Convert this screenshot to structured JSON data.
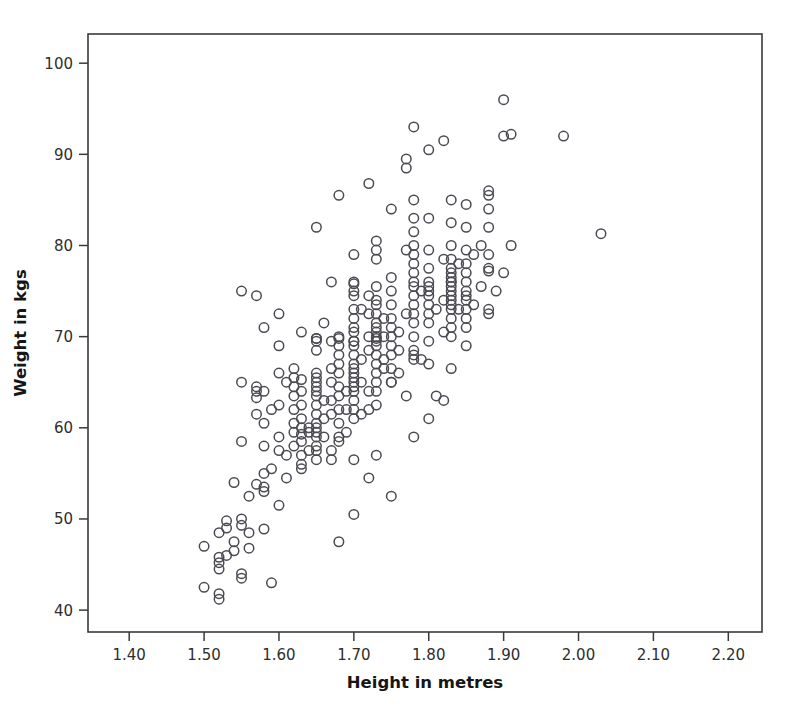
{
  "chart_data": {
    "type": "scatter",
    "title": "",
    "xlabel": "Height in metres",
    "ylabel": "Weight in kgs",
    "xlim": [
      1.345,
      2.245
    ],
    "ylim": [
      37.6,
      103.2
    ],
    "xticks": [
      "1.40",
      "1.50",
      "1.60",
      "1.70",
      "1.80",
      "1.90",
      "2.00",
      "2.10",
      "2.20"
    ],
    "xtick_values": [
      1.4,
      1.5,
      1.6,
      1.7,
      1.8,
      1.9,
      2.0,
      2.1,
      2.2
    ],
    "yticks": [
      "40",
      "50",
      "60",
      "70",
      "80",
      "90",
      "100"
    ],
    "ytick_values": [
      40,
      50,
      60,
      70,
      80,
      90,
      100
    ],
    "grid": false,
    "legend": null,
    "marker": "open-circle",
    "marker_color": "#4a4a52",
    "marker_size": 9.5,
    "n_points": 312,
    "x": [
      1.5,
      1.5,
      1.52,
      1.52,
      1.52,
      1.52,
      1.52,
      1.52,
      1.53,
      1.53,
      1.53,
      1.54,
      1.54,
      1.54,
      1.55,
      1.55,
      1.55,
      1.55,
      1.55,
      1.55,
      1.55,
      1.56,
      1.56,
      1.56,
      1.57,
      1.57,
      1.57,
      1.57,
      1.57,
      1.57,
      1.58,
      1.58,
      1.58,
      1.58,
      1.58,
      1.58,
      1.58,
      1.58,
      1.59,
      1.59,
      1.59,
      1.6,
      1.6,
      1.6,
      1.6,
      1.6,
      1.6,
      1.6,
      1.61,
      1.61,
      1.61,
      1.62,
      1.62,
      1.62,
      1.62,
      1.62,
      1.62,
      1.62,
      1.62,
      1.63,
      1.63,
      1.63,
      1.63,
      1.63,
      1.63,
      1.63,
      1.63,
      1.63,
      1.63,
      1.63,
      1.64,
      1.64,
      1.64,
      1.65,
      1.65,
      1.65,
      1.65,
      1.65,
      1.65,
      1.65,
      1.65,
      1.65,
      1.65,
      1.65,
      1.65,
      1.65,
      1.65,
      1.65,
      1.65,
      1.65,
      1.65,
      1.65,
      1.66,
      1.66,
      1.66,
      1.66,
      1.67,
      1.67,
      1.67,
      1.67,
      1.67,
      1.67,
      1.67,
      1.67,
      1.68,
      1.68,
      1.68,
      1.68,
      1.68,
      1.68,
      1.68,
      1.68,
      1.68,
      1.68,
      1.68,
      1.68,
      1.68,
      1.69,
      1.69,
      1.69,
      1.7,
      1.7,
      1.7,
      1.7,
      1.7,
      1.7,
      1.7,
      1.7,
      1.7,
      1.7,
      1.7,
      1.7,
      1.7,
      1.7,
      1.7,
      1.7,
      1.7,
      1.7,
      1.7,
      1.7,
      1.7,
      1.7,
      1.7,
      1.7,
      1.71,
      1.71,
      1.71,
      1.71,
      1.72,
      1.72,
      1.72,
      1.72,
      1.72,
      1.72,
      1.72,
      1.72,
      1.73,
      1.73,
      1.73,
      1.73,
      1.73,
      1.73,
      1.73,
      1.73,
      1.73,
      1.73,
      1.73,
      1.73,
      1.73,
      1.73,
      1.73,
      1.73,
      1.73,
      1.73,
      1.73,
      1.73,
      1.74,
      1.74,
      1.74,
      1.74,
      1.75,
      1.75,
      1.75,
      1.75,
      1.75,
      1.75,
      1.75,
      1.75,
      1.75,
      1.75,
      1.75,
      1.75,
      1.76,
      1.76,
      1.76,
      1.77,
      1.77,
      1.77,
      1.77,
      1.77,
      1.78,
      1.78,
      1.78,
      1.78,
      1.78,
      1.78,
      1.78,
      1.78,
      1.78,
      1.78,
      1.78,
      1.78,
      1.78,
      1.78,
      1.78,
      1.78,
      1.78,
      1.78,
      1.79,
      1.79,
      1.8,
      1.8,
      1.8,
      1.8,
      1.8,
      1.8,
      1.8,
      1.8,
      1.8,
      1.8,
      1.8,
      1.8,
      1.8,
      1.8,
      1.81,
      1.81,
      1.82,
      1.82,
      1.82,
      1.82,
      1.82,
      1.83,
      1.83,
      1.83,
      1.83,
      1.83,
      1.83,
      1.83,
      1.83,
      1.83,
      1.83,
      1.83,
      1.83,
      1.83,
      1.83,
      1.83,
      1.83,
      1.83,
      1.83,
      1.84,
      1.84,
      1.85,
      1.85,
      1.85,
      1.85,
      1.85,
      1.85,
      1.85,
      1.85,
      1.85,
      1.85,
      1.85,
      1.85,
      1.85,
      1.86,
      1.86,
      1.87,
      1.87,
      1.88,
      1.88,
      1.88,
      1.88,
      1.88,
      1.88,
      1.88,
      1.88,
      1.88,
      1.89,
      1.9,
      1.9,
      1.9,
      1.91,
      1.91,
      1.98,
      2.03,
      1.65,
      1.68,
      1.7,
      1.73,
      1.75,
      1.78,
      1.83
    ],
    "y": [
      47.0,
      42.5,
      45.8,
      45.2,
      44.5,
      41.8,
      41.2,
      48.5,
      49.8,
      49.0,
      46.0,
      54.0,
      47.5,
      46.5,
      75.0,
      65.0,
      58.5,
      50.0,
      49.3,
      44.0,
      43.5,
      52.5,
      48.5,
      46.8,
      74.5,
      64.5,
      64.0,
      63.3,
      61.5,
      53.8,
      71.0,
      64.0,
      60.5,
      58.0,
      55.0,
      53.5,
      53.0,
      48.9,
      62.0,
      55.5,
      43.0,
      72.5,
      69.0,
      66.0,
      62.5,
      59.0,
      57.5,
      51.5,
      65.0,
      57.0,
      54.5,
      66.5,
      65.5,
      64.5,
      63.5,
      62.0,
      60.5,
      59.5,
      58.0,
      70.5,
      65.3,
      64.0,
      62.5,
      61.0,
      60.0,
      59.3,
      58.5,
      57.0,
      56.0,
      55.5,
      60.0,
      59.5,
      57.5,
      82.0,
      69.8,
      69.5,
      68.5,
      66.0,
      65.5,
      65.0,
      64.5,
      64.0,
      63.5,
      62.5,
      61.5,
      60.5,
      60.0,
      59.5,
      59.0,
      58.0,
      57.5,
      56.5,
      71.5,
      63.0,
      61.0,
      59.0,
      76.0,
      69.5,
      66.5,
      65.0,
      63.0,
      61.5,
      57.5,
      56.5,
      85.5,
      70.0,
      69.0,
      68.0,
      67.0,
      66.0,
      64.5,
      63.5,
      62.0,
      60.5,
      59.0,
      58.5,
      47.5,
      64.0,
      62.0,
      59.5,
      79.0,
      76.0,
      75.8,
      75.0,
      74.5,
      73.0,
      72.0,
      71.0,
      70.5,
      69.5,
      69.0,
      68.0,
      67.0,
      66.5,
      66.0,
      65.5,
      65.0,
      64.5,
      64.0,
      63.0,
      62.0,
      61.0,
      56.5,
      50.5,
      73.0,
      67.5,
      65.0,
      61.5,
      86.8,
      74.5,
      72.5,
      70.0,
      68.5,
      64.0,
      62.0,
      54.5,
      80.5,
      79.5,
      78.5,
      75.5,
      74.0,
      73.5,
      72.5,
      71.5,
      71.0,
      70.5,
      70.0,
      69.5,
      69.0,
      68.0,
      67.0,
      66.0,
      65.0,
      64.0,
      62.5,
      57.0,
      72.0,
      70.0,
      67.5,
      66.5,
      84.0,
      76.5,
      75.0,
      73.5,
      72.0,
      71.0,
      70.0,
      69.0,
      68.0,
      66.5,
      65.0,
      52.5,
      70.5,
      68.5,
      66.0,
      89.5,
      88.5,
      79.5,
      72.5,
      63.5,
      93.0,
      85.0,
      83.0,
      81.5,
      80.0,
      79.0,
      78.0,
      77.0,
      76.0,
      75.5,
      74.5,
      73.5,
      72.5,
      71.5,
      70.0,
      68.5,
      67.5,
      59.0,
      75.0,
      67.5,
      90.5,
      83.0,
      79.5,
      77.5,
      76.0,
      75.5,
      75.0,
      74.5,
      73.5,
      72.5,
      71.5,
      69.5,
      67.0,
      61.0,
      73.0,
      63.5,
      91.5,
      78.5,
      74.0,
      70.5,
      63.0,
      85.0,
      82.5,
      80.0,
      78.5,
      77.5,
      77.0,
      76.5,
      76.0,
      75.5,
      75.0,
      74.5,
      74.0,
      73.5,
      73.0,
      72.0,
      71.0,
      70.0,
      66.5,
      78.0,
      73.0,
      84.5,
      82.0,
      79.5,
      78.0,
      77.0,
      76.0,
      75.0,
      74.5,
      74.0,
      73.0,
      72.0,
      71.0,
      69.0,
      79.0,
      73.5,
      80.0,
      75.5,
      86.0,
      85.5,
      84.0,
      82.0,
      79.0,
      77.5,
      77.2,
      73.0,
      72.5,
      75.0,
      96.0,
      92.0,
      77.0,
      92.2,
      80.0,
      92.0,
      81.3,
      69.8,
      69.8,
      69.5,
      69.8,
      65.0,
      68.0,
      76.0
    ]
  }
}
